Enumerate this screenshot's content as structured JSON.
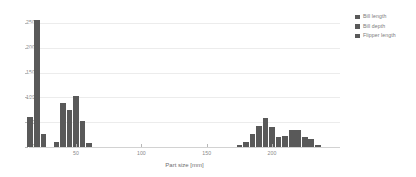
{
  "chart_data": {
    "type": "bar",
    "title": "",
    "subtitle": "",
    "xlabel": "Part size [mm]",
    "ylabel": "",
    "xlim": [
      14,
      252
    ],
    "ylim": [
      0,
      268
    ],
    "grid": true,
    "legend_position": "right",
    "xticks": [
      50,
      100,
      150,
      200
    ],
    "yticks": [
      0,
      50,
      100,
      150,
      200,
      250
    ],
    "bin_width_mm": 5,
    "series": [
      {
        "name": "Bill length",
        "color": "#595959",
        "bins": [
          {
            "x": 35,
            "value": 10
          },
          {
            "x": 40,
            "value": 88
          },
          {
            "x": 45,
            "value": 74
          },
          {
            "x": 50,
            "value": 103
          },
          {
            "x": 55,
            "value": 53
          },
          {
            "x": 60,
            "value": 9
          }
        ]
      },
      {
        "name": "Bill depth",
        "color": "#595959",
        "bins": [
          {
            "x": 15,
            "value": 60
          },
          {
            "x": 20,
            "value": 255
          },
          {
            "x": 25,
            "value": 27
          }
        ]
      },
      {
        "name": "Flipper length",
        "color": "#595959",
        "bins": [
          {
            "x": 175,
            "value": 4
          },
          {
            "x": 180,
            "value": 10
          },
          {
            "x": 185,
            "value": 26
          },
          {
            "x": 190,
            "value": 42
          },
          {
            "x": 195,
            "value": 58
          },
          {
            "x": 200,
            "value": 41
          },
          {
            "x": 205,
            "value": 21
          },
          {
            "x": 210,
            "value": 22
          },
          {
            "x": 215,
            "value": 35
          },
          {
            "x": 220,
            "value": 34
          },
          {
            "x": 225,
            "value": 21
          },
          {
            "x": 230,
            "value": 17
          },
          {
            "x": 235,
            "value": 5
          }
        ]
      }
    ]
  },
  "legend": {
    "items": [
      {
        "label": "Bill length",
        "color": "#595959"
      },
      {
        "label": "Bill depth",
        "color": "#595959"
      },
      {
        "label": "Flipper length",
        "color": "#595959"
      }
    ]
  },
  "axes": {
    "y_tick_labels": [
      "0",
      "50",
      "100",
      "150",
      "200",
      "250"
    ],
    "x_tick_labels": [
      "50",
      "100",
      "150",
      "200"
    ],
    "x_title": "Part size [mm]"
  }
}
